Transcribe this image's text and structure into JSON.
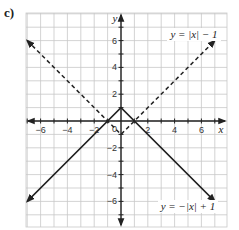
{
  "part_label": "c)",
  "chart_data": {
    "type": "line",
    "title": "",
    "xlabel": "x",
    "ylabel": "y",
    "xlim": [
      -7,
      7.5
    ],
    "ylim": [
      -7.5,
      8
    ],
    "grid": true,
    "x_ticks": [
      -6,
      -4,
      -2,
      2,
      4,
      6
    ],
    "y_ticks": [
      -6,
      -4,
      -2,
      2,
      4,
      6
    ],
    "x_tick_labels": [
      "−6",
      "−4",
      "−2",
      "2",
      "4",
      "6"
    ],
    "y_tick_labels": [
      "−6",
      "−4",
      "−2",
      "2",
      "4",
      "6"
    ],
    "origin_label": "0",
    "series": [
      {
        "name": "y = |x| − 1",
        "style": "dashed",
        "x": [
          -7,
          0,
          7
        ],
        "y": [
          6,
          -1,
          6
        ]
      },
      {
        "name": "y = −|x| + 1",
        "style": "solid",
        "x": [
          -7,
          0,
          7
        ],
        "y": [
          -6,
          1,
          -6
        ]
      }
    ],
    "annotations": [
      {
        "text": "y = |x| − 1",
        "position": "top-right"
      },
      {
        "text": "y = −|x| + 1",
        "position": "bottom-right"
      }
    ]
  }
}
